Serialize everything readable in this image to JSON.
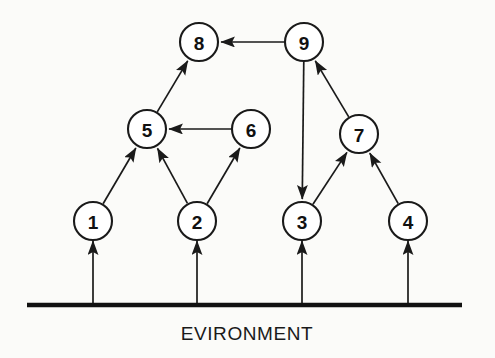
{
  "figure": {
    "type": "directed-graph",
    "background_color": "#fbfbf9",
    "line_color": "#1a1a1a",
    "node_fill_color": "#ffffff",
    "width": 495,
    "height": 358
  },
  "nodes": [
    {
      "id": "1",
      "label": "1",
      "cx": 93,
      "cy": 221,
      "r": 19
    },
    {
      "id": "2",
      "label": "2",
      "cx": 197,
      "cy": 221,
      "r": 19
    },
    {
      "id": "3",
      "label": "3",
      "cx": 302,
      "cy": 221,
      "r": 19
    },
    {
      "id": "4",
      "label": "4",
      "cx": 408,
      "cy": 221,
      "r": 19
    },
    {
      "id": "5",
      "label": "5",
      "cx": 147,
      "cy": 129,
      "r": 19
    },
    {
      "id": "6",
      "label": "6",
      "cx": 251,
      "cy": 129,
      "r": 19
    },
    {
      "id": "7",
      "label": "7",
      "cx": 359,
      "cy": 134,
      "r": 19
    },
    {
      "id": "8",
      "label": "8",
      "cx": 199,
      "cy": 42,
      "r": 19
    },
    {
      "id": "9",
      "label": "9",
      "cx": 304,
      "cy": 42,
      "r": 19
    }
  ],
  "edges": [
    {
      "from": "1",
      "to": "5",
      "arrow": true
    },
    {
      "from": "2",
      "to": "5",
      "arrow": true
    },
    {
      "from": "2",
      "to": "6",
      "arrow": true
    },
    {
      "from": "6",
      "to": "5",
      "arrow": true
    },
    {
      "from": "5",
      "to": "8",
      "arrow": true
    },
    {
      "from": "9",
      "to": "8",
      "arrow": true
    },
    {
      "from": "9",
      "to": "3",
      "arrow": true
    },
    {
      "from": "3",
      "to": "7",
      "arrow": true
    },
    {
      "from": "4",
      "to": "7",
      "arrow": true
    },
    {
      "from": "7",
      "to": "9",
      "arrow": true
    }
  ],
  "environment": {
    "label": "EVIRONMENT",
    "baseline_y": 305,
    "baseline_x_start": 27,
    "baseline_x_end": 462,
    "label_x": 247,
    "label_y": 340,
    "inputs": [
      {
        "to": "1",
        "x": 93,
        "from_y": 305,
        "to_y": 241
      },
      {
        "to": "2",
        "x": 197,
        "from_y": 305,
        "to_y": 241
      },
      {
        "to": "3",
        "x": 302,
        "from_y": 305,
        "to_y": 241
      },
      {
        "to": "4",
        "x": 408,
        "from_y": 305,
        "to_y": 241
      }
    ]
  }
}
